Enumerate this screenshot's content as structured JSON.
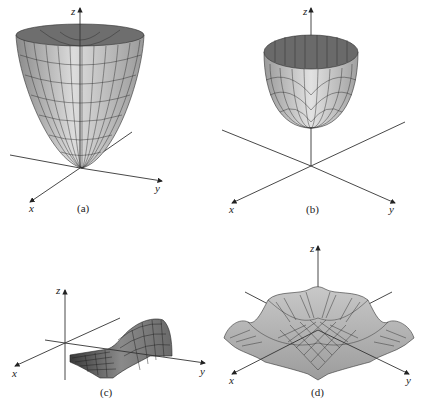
{
  "figure": {
    "panels": [
      {
        "id": "a",
        "caption": "(a)",
        "axes": {
          "x": "x",
          "y": "y",
          "z": "z"
        },
        "surface": "paraboloid (wide bowl)"
      },
      {
        "id": "b",
        "caption": "(b)",
        "axes": {
          "x": "x",
          "y": "y",
          "z": "z"
        },
        "surface": "paraboloid (narrow cup)"
      },
      {
        "id": "c",
        "caption": "(c)",
        "axes": {
          "x": "x",
          "y": "y",
          "z": "z"
        },
        "surface": "ridge / wave surface"
      },
      {
        "id": "d",
        "caption": "(d)",
        "axes": {
          "x": "x",
          "y": "y",
          "z": "z"
        },
        "surface": "rippled radial surface"
      }
    ],
    "colors": {
      "surface_light": "#d8d8d8",
      "surface_mid": "#a8a8a8",
      "surface_dark": "#5a5a5a",
      "axis": "#333333"
    }
  }
}
